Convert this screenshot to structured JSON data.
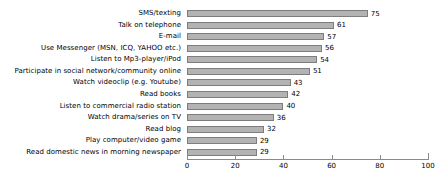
{
  "chart_data": {
    "type": "bar",
    "orientation": "horizontal",
    "title": "",
    "xlabel": "",
    "ylabel": "",
    "xlim": [
      0,
      100
    ],
    "xticks": [
      0,
      20,
      40,
      60,
      80,
      100
    ],
    "grid": false,
    "legend": null,
    "bar_color": "#b3b3b3",
    "bar_edge_color": "#7d7d7d",
    "categories": [
      "SMS/texting",
      "Talk on telephone",
      "E-mail",
      "Use Messenger (MSN, ICQ, YAHOO etc.)",
      "Listen to Mp3-player/iPod",
      "Participate in social network/community online",
      "Watch videoclip (e.g. Youtube)",
      "Read books",
      "Listen to commercial radio station",
      "Watch drama/series on TV",
      "Read blog",
      "Play computer/video game",
      "Read domestic news in morning newspaper"
    ],
    "values": [
      75,
      61,
      57,
      56,
      54,
      51,
      43,
      42,
      40,
      36,
      32,
      29,
      29
    ],
    "value_labels": [
      "75",
      "61",
      "57",
      "56",
      "54",
      "51",
      "43",
      "42",
      "40",
      "36",
      "32",
      "29",
      "29"
    ],
    "tick_labels": [
      "0",
      "20",
      "40",
      "60",
      "80",
      "100"
    ]
  }
}
